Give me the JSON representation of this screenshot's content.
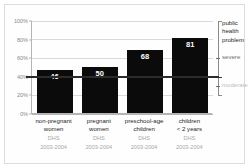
{
  "chart_data": {
    "type": "bar",
    "title": "",
    "subtitle": "",
    "xlabel": "",
    "ylabel": "",
    "ylim": [
      0,
      100
    ],
    "grid": true,
    "legend_position": "right",
    "categories": [
      "non-pregnant\nwomen",
      "pregnant\nwomen",
      "preschool-age\nchildren",
      "children\n< 2 years"
    ],
    "values": [
      46,
      50,
      68,
      81
    ],
    "value_labels": [
      "46",
      "50",
      "68",
      "81"
    ],
    "category_sources": [
      "DHS",
      "DHS",
      "DHS",
      "DHS"
    ],
    "category_years": [
      "2003-2004",
      "2003-2004",
      "2003-2004",
      "2003-2004"
    ],
    "yticks": [
      0,
      20,
      40,
      60,
      80,
      100
    ],
    "ytick_labels": [
      "0%",
      "20%",
      "40%",
      "60%",
      "80%",
      "100%"
    ],
    "threshold_line": 40,
    "annotations": [
      {
        "label": "public\nhealth\nproblem",
        "from": 100,
        "to": 40
      },
      {
        "label": "severe",
        "at": 60
      },
      {
        "label": "moderate",
        "at": 30
      }
    ],
    "colors": {
      "bar": "#0b0b0b",
      "value_label": "#ffffff",
      "grid": "#d9d9d9",
      "axis": "#b4b4b4",
      "threshold": "#2b2b2b",
      "tick_label": "#8a8a8a",
      "category_label": "#1e1e1e",
      "source_label": "#a8a8a8",
      "annotation_dark": "#1e1e1e",
      "annotation_mid": "#6e6e6e",
      "annotation_light": "#bdbdbd",
      "background": "#ffffff",
      "frame": "#dcdcdc"
    }
  }
}
